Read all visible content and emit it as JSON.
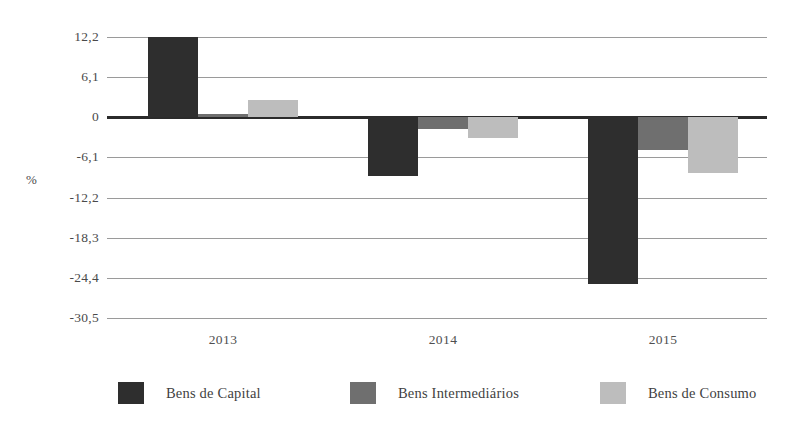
{
  "chart_data": {
    "type": "bar",
    "title": "",
    "subtitle": "",
    "xlabel": "",
    "ylabel": "%",
    "categories": [
      "2013",
      "2014",
      "2015"
    ],
    "series": [
      {
        "name": "Bens de Capital",
        "key": "capital",
        "color": "#2e2e2e",
        "values": [
          12.2,
          -8.9,
          -25.3
        ]
      },
      {
        "name": "Bens Intermediários",
        "key": "intermediario",
        "color": "#6f6f6f",
        "values": [
          0.5,
          -1.8,
          -4.9
        ]
      },
      {
        "name": "Bens de Consumo",
        "key": "consumo",
        "color": "#bdbdbd",
        "values": [
          2.7,
          -3.2,
          -8.5
        ]
      }
    ],
    "ylim": [
      -30.5,
      12.2
    ],
    "yticks": [
      "12,2",
      "6,1",
      "0",
      "-6,1",
      "-12,2",
      "-18,3",
      "-24,4",
      "-30,5"
    ],
    "ytick_values": [
      12.2,
      6.1,
      0,
      -6.1,
      -12.2,
      -18.3,
      -24.4,
      -30.5
    ],
    "grid": true,
    "legend_position": "bottom"
  },
  "legend": {
    "items": [
      {
        "label": "Bens de Capital",
        "color": "#2e2e2e"
      },
      {
        "label": "Bens Intermediários",
        "color": "#6f6f6f"
      },
      {
        "label": "Bens de Consumo",
        "color": "#bdbdbd"
      }
    ]
  }
}
